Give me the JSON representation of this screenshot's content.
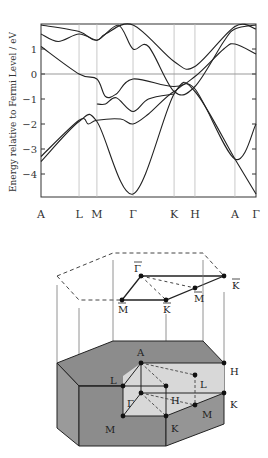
{
  "chart_data": {
    "type": "line",
    "title": "",
    "ylabel": "Energy relative to Fermi Level / eV",
    "xlabel": "",
    "ylim": [
      -5,
      2
    ],
    "yticks": [
      1,
      0,
      -1,
      -2,
      -3,
      -4
    ],
    "ytick_labels": [
      "1",
      "0",
      "−1",
      "−2",
      "−3",
      "−4"
    ],
    "kpath_labels": [
      "A",
      "L",
      "M",
      "Γ",
      "K",
      "H",
      "A",
      "Γ"
    ],
    "kpath_positions": [
      0,
      0.177,
      0.26,
      0.428,
      0.619,
      0.716,
      0.902,
      1.0
    ],
    "fermi_level": 0,
    "grid": "vertical lines at high-symmetry points",
    "series": [
      {
        "name": "band1",
        "points": [
          [
            0,
            -3.5
          ],
          [
            0.177,
            -1.9
          ],
          [
            0.26,
            -1.9
          ],
          [
            0.428,
            -4.8
          ],
          [
            0.619,
            -0.8
          ],
          [
            0.716,
            -0.7
          ],
          [
            0.902,
            -3.4
          ],
          [
            1.0,
            -4.8
          ]
        ]
      },
      {
        "name": "band2",
        "points": [
          [
            0,
            -3.3
          ],
          [
            0.177,
            -1.85
          ],
          [
            0.22,
            -2.0
          ],
          [
            0.26,
            -1.85
          ],
          [
            0.37,
            -1.8
          ],
          [
            0.428,
            -2.0
          ],
          [
            0.5,
            -1.6
          ],
          [
            0.619,
            -0.7
          ],
          [
            0.716,
            -0.6
          ],
          [
            0.902,
            -3.4
          ],
          [
            1.0,
            -2.0
          ]
        ]
      },
      {
        "name": "band3",
        "points": [
          [
            0,
            1.1
          ],
          [
            0.177,
            0
          ],
          [
            0.26,
            -0.2
          ],
          [
            0.3,
            -0.9
          ],
          [
            0.35,
            -0.8
          ],
          [
            0.428,
            -0.2
          ],
          [
            0.619,
            -0.5
          ],
          [
            0.716,
            -0.1
          ],
          [
            0.85,
            1.0
          ],
          [
            0.902,
            1.2
          ],
          [
            1.0,
            0.8
          ]
        ]
      },
      {
        "name": "band4",
        "points": [
          [
            0,
            1.6
          ],
          [
            0.08,
            1.3
          ],
          [
            0.177,
            1.6
          ],
          [
            0.26,
            1.35
          ],
          [
            0.3,
            1.6
          ],
          [
            0.428,
            2.0
          ],
          [
            0.619,
            0.5
          ],
          [
            0.716,
            0.3
          ],
          [
            0.902,
            1.9
          ],
          [
            1.0,
            1.8
          ]
        ]
      },
      {
        "name": "band5",
        "points": [
          [
            0,
            2.0
          ],
          [
            0.177,
            1.7
          ],
          [
            0.26,
            1.35
          ],
          [
            0.36,
            1.95
          ],
          [
            0.428,
            1.0
          ],
          [
            0.5,
            1.1
          ],
          [
            0.619,
            -0.7
          ],
          [
            0.716,
            -0.5
          ],
          [
            0.85,
            1.3
          ],
          [
            0.902,
            1.8
          ],
          [
            1.0,
            2.0
          ]
        ]
      },
      {
        "name": "band6",
        "points": [
          [
            0.26,
            -1.2
          ],
          [
            0.3,
            -1.2
          ],
          [
            0.35,
            -0.95
          ],
          [
            0.428,
            -1.5
          ],
          [
            0.5,
            -1.0
          ],
          [
            0.619,
            -0.8
          ]
        ]
      }
    ]
  },
  "bz_top": {
    "labels": [
      {
        "text": "Γ",
        "bar": true,
        "x": 134,
        "y": 272
      },
      {
        "text": "M",
        "bar": true,
        "x": 118,
        "y": 313
      },
      {
        "text": "K",
        "bar": true,
        "x": 163,
        "y": 313
      },
      {
        "text": "M",
        "bar": true,
        "x": 194,
        "y": 302
      },
      {
        "text": "K",
        "bar": true,
        "x": 232,
        "y": 289
      }
    ]
  },
  "bz_bottom": {
    "labels": [
      {
        "text": "A",
        "x": 137,
        "y": 356
      },
      {
        "text": "L",
        "x": 110,
        "y": 384
      },
      {
        "text": "Γ",
        "x": 127,
        "y": 407
      },
      {
        "text": "H",
        "x": 171,
        "y": 404
      },
      {
        "text": "L",
        "x": 200,
        "y": 388
      },
      {
        "text": "H",
        "x": 230,
        "y": 375
      },
      {
        "text": "K",
        "x": 230,
        "y": 408
      },
      {
        "text": "M",
        "x": 105,
        "y": 433
      },
      {
        "text": "M",
        "x": 202,
        "y": 418
      },
      {
        "text": "K",
        "x": 171,
        "y": 432
      }
    ]
  },
  "colors": {
    "prism_dark": "#8c8c8c",
    "prism_mid": "#9a9a9a",
    "prism_light": "#d8d8d8",
    "line": "#222222",
    "grid": "#bbbbbb"
  }
}
